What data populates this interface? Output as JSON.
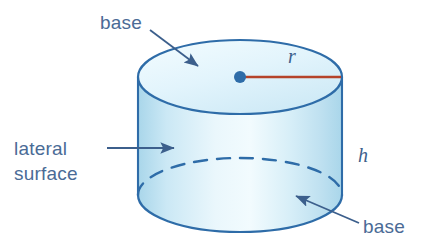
{
  "figure": {
    "shape": "cylinder",
    "background_color": "#ffffff"
  },
  "colors": {
    "outline": "#2e6ca8",
    "fill_light": "#e6f4fb",
    "fill_mid": "#cde9f5",
    "fill_dark": "#a9d6ea",
    "label_text": "#4a6b96",
    "variable_text": "#3c5f8c",
    "radius_line": "#b5432a",
    "center_dot": "#2e6ca8",
    "arrow": "#3c5f8c"
  },
  "labels": {
    "base_top": "base",
    "lateral_line1": "lateral",
    "lateral_line2": "surface",
    "base_bottom": "base",
    "radius": "r",
    "height": "h"
  },
  "annotations": [
    {
      "name": "base-top",
      "text": "base",
      "target": "top base (upper ellipse face)"
    },
    {
      "name": "lateral-surface",
      "text": "lateral surface",
      "target": "curved side wall"
    },
    {
      "name": "base-bottom",
      "text": "base",
      "target": "bottom base (lower ellipse face)"
    },
    {
      "name": "radius",
      "text": "r",
      "target": "radius segment from center to rim"
    },
    {
      "name": "height",
      "text": "h",
      "target": "vertical height of cylinder"
    }
  ],
  "geometry": {
    "center_x": 240,
    "top_ellipse_cy": 77,
    "bottom_ellipse_cy": 195,
    "rx": 102,
    "ry": 37,
    "height_px": 118
  }
}
